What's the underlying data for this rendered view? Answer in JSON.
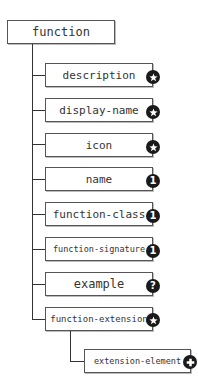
{
  "root": {
    "label": "function"
  },
  "children": [
    {
      "label": "description",
      "cardinality": "zero-or-more",
      "badge_icon": "star-icon"
    },
    {
      "label": "display-name",
      "cardinality": "zero-or-more",
      "badge_icon": "star-icon"
    },
    {
      "label": "icon",
      "cardinality": "zero-or-more",
      "badge_icon": "star-icon"
    },
    {
      "label": "name",
      "cardinality": "exactly-one",
      "badge_text": "1"
    },
    {
      "label": "function-class",
      "cardinality": "exactly-one",
      "badge_text": "1"
    },
    {
      "label": "function-signature",
      "cardinality": "exactly-one",
      "badge_text": "1"
    },
    {
      "label": "example",
      "cardinality": "optional",
      "badge_text": "?"
    },
    {
      "label": "function-extension",
      "cardinality": "zero-or-more",
      "badge_icon": "star-icon",
      "children": [
        {
          "label": "extension-element",
          "cardinality": "one-or-more",
          "badge_icon": "plus-icon"
        }
      ]
    }
  ],
  "colors": {
    "line": "#333333",
    "border": "#555555",
    "badge": "#1a1a1a",
    "text": "#333333"
  }
}
